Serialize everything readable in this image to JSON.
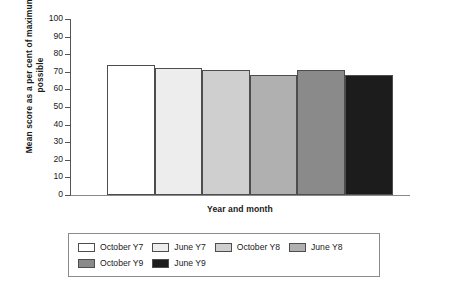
{
  "chart_data": {
    "type": "bar",
    "title": "",
    "xlabel": "Year and month",
    "ylabel": "Mean score as a per cent of maximum possible",
    "ylim": [
      0,
      100
    ],
    "ytick_labels": [
      "100",
      "90",
      "80",
      "70",
      "60",
      "50",
      "40",
      "30",
      "20",
      "10",
      "0"
    ],
    "ytick_values": [
      100,
      90,
      80,
      70,
      60,
      50,
      40,
      30,
      20,
      10,
      0
    ],
    "grid": false,
    "legend_position": "bottom",
    "categories": [
      "October Y7",
      "June Y7",
      "October Y8",
      "June Y8",
      "October Y9",
      "June Y9"
    ],
    "values": [
      74,
      72,
      71,
      68,
      71,
      68
    ],
    "colors": [
      "#ffffff",
      "#ededed",
      "#cfcfcf",
      "#b0b0b0",
      "#8a8a8a",
      "#1c1c1c"
    ],
    "bar_edge_color": "#4d4d4d"
  },
  "axes": {
    "y_title": "Mean score as a per cent of maximum possible",
    "x_title": "Year and month"
  },
  "legend": {
    "entries": [
      {
        "label": "October Y7",
        "color": "#ffffff"
      },
      {
        "label": "June Y7",
        "color": "#ededed"
      },
      {
        "label": "October Y8",
        "color": "#cfcfcf"
      },
      {
        "label": "June Y8",
        "color": "#b0b0b0"
      },
      {
        "label": "October Y9",
        "color": "#8a8a8a"
      },
      {
        "label": "June Y9",
        "color": "#1c1c1c"
      }
    ]
  }
}
